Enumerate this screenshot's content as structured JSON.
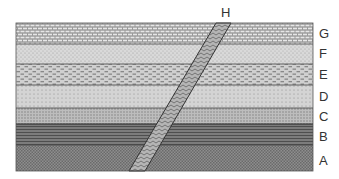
{
  "diagram": {
    "type": "geologic cross-section",
    "intrusion_label": "H",
    "layers": [
      {
        "id": "G",
        "label": "G",
        "pattern": "limestone-brick",
        "top": 23,
        "bottom": 44
      },
      {
        "id": "F",
        "label": "F",
        "pattern": "fine-dots",
        "top": 44,
        "bottom": 64
      },
      {
        "id": "E",
        "label": "E",
        "pattern": "dashes",
        "top": 64,
        "bottom": 85
      },
      {
        "id": "D",
        "label": "D",
        "pattern": "sparse-dots",
        "top": 85,
        "bottom": 108
      },
      {
        "id": "C",
        "label": "C",
        "pattern": "dense-dots",
        "top": 108,
        "bottom": 124
      },
      {
        "id": "B",
        "label": "B",
        "pattern": "horizontal-lines",
        "top": 124,
        "bottom": 145
      },
      {
        "id": "A",
        "label": "A",
        "pattern": "checker",
        "top": 145,
        "bottom": 171
      }
    ]
  }
}
